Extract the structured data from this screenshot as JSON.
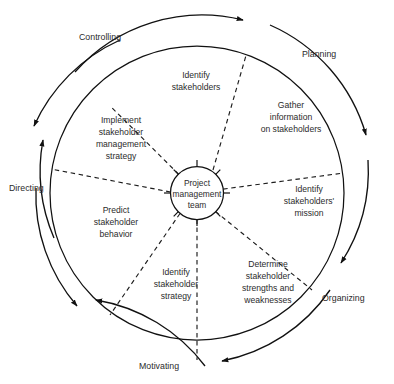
{
  "diagram": {
    "center": {
      "line1": "Project",
      "line2": "management",
      "line3": "team"
    },
    "sectors": [
      {
        "id": "identify-stakeholders",
        "lines": [
          "Identify",
          "stakeholders"
        ],
        "angle_deg": -90
      },
      {
        "id": "gather-information-on-stakeholders",
        "lines": [
          "Gather",
          "information",
          "on stakeholders"
        ],
        "angle_deg": -30
      },
      {
        "id": "identify-stakeholders-mission",
        "lines": [
          "Identify",
          "stakeholders'",
          "mission"
        ],
        "angle_deg": 25
      },
      {
        "id": "determine-stakeholder-strengths-and-weaknesses",
        "lines": [
          "Determine",
          "stakeholder",
          "strengths and",
          "weaknesses"
        ],
        "angle_deg": 70
      },
      {
        "id": "identify-stakeholder-strategy",
        "lines": [
          "Identify",
          "stakeholder",
          "strategy"
        ],
        "angle_deg": 112
      },
      {
        "id": "predict-stakeholder-behavior",
        "lines": [
          "Predict",
          "stakeholder",
          "behavior"
        ],
        "angle_deg": 155
      },
      {
        "id": "implement-stakeholder-management-strategy",
        "lines": [
          "Implement",
          "stakeholder",
          "management",
          "strategy"
        ],
        "angle_deg": 210
      }
    ],
    "outer_functions": [
      {
        "id": "controlling",
        "label": "Controlling"
      },
      {
        "id": "planning",
        "label": "Planning"
      },
      {
        "id": "organizing",
        "label": "Organizing"
      },
      {
        "id": "motivating",
        "label": "Motivating"
      },
      {
        "id": "directing",
        "label": "Directing"
      }
    ],
    "colors": {
      "stroke": "#111111",
      "text": "#2b2b2b",
      "background": "#ffffff"
    }
  }
}
